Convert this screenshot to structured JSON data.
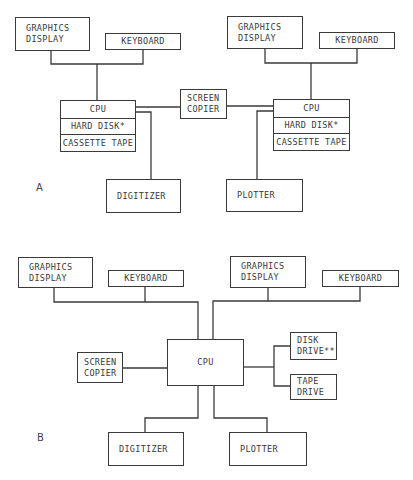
{
  "diagram_a": {
    "label": "A",
    "left_station": {
      "graphics_display": [
        "GRAPHICS",
        "DISPLAY"
      ],
      "keyboard": "KEYBOARD",
      "cpu_stack": [
        "CPU",
        "HARD DISK*",
        "CASSETTE TAPE"
      ],
      "digitizer": "DIGITIZER"
    },
    "screen_copier": [
      "SCREEN",
      "COPIER"
    ],
    "right_station": {
      "graphics_display": [
        "GRAPHICS",
        "DISPLAY"
      ],
      "keyboard": "KEYBOARD",
      "cpu_stack": [
        "CPU",
        "HARD DISK*",
        "CASSETTE TAPE"
      ],
      "plotter": "PLOTTER"
    }
  },
  "diagram_b": {
    "label": "B",
    "left_graphics_display": [
      "GRAPHICS",
      "DISPLAY"
    ],
    "left_keyboard": "KEYBOARD",
    "right_graphics_display": [
      "GRAPHICS",
      "DISPLAY"
    ],
    "right_keyboard": "KEYBOARD",
    "cpu": "CPU",
    "screen_copier": [
      "SCREEN",
      "COPIER"
    ],
    "disk_drive": [
      "DISK",
      "DRIVE**"
    ],
    "tape_drive": [
      "TAPE",
      "DRIVE"
    ],
    "digitizer": "DIGITIZER",
    "plotter": "PLOTTER"
  },
  "colors": {
    "line": "#3a3a3a",
    "background": "#ffffff"
  }
}
